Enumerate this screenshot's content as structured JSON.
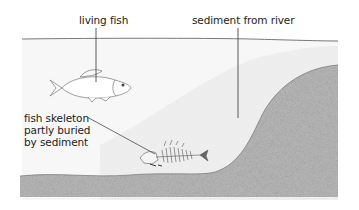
{
  "diagram": {
    "labels": {
      "living_fish": "living fish",
      "sediment_from_river": "sediment from river",
      "fish_skeleton": [
        "fish skeleton",
        "partly buried",
        "by sediment"
      ]
    },
    "colors": {
      "water": "#f6f6f6",
      "sediment_light": "#ededed",
      "rock_dark": "#a9a9a9",
      "line": "#444444",
      "fish_outline": "#777777"
    }
  }
}
